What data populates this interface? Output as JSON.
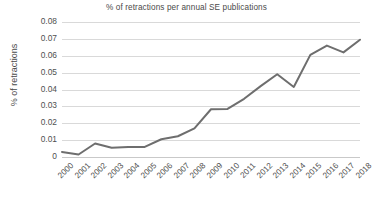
{
  "chart_data": {
    "type": "line",
    "title": "% of retractions per annual SE publications",
    "xlabel": "",
    "ylabel": "% of retractions",
    "categories": [
      "2000",
      "2001",
      "2002",
      "2003",
      "2004",
      "2005",
      "2006",
      "2007",
      "2008",
      "2009",
      "2010",
      "2011",
      "2012",
      "2013",
      "2014",
      "2015",
      "2016",
      "2017",
      "2018"
    ],
    "values": [
      0.003,
      0.0015,
      0.008,
      0.0055,
      0.006,
      0.006,
      0.0105,
      0.0123,
      0.017,
      0.0283,
      0.0285,
      0.0345,
      0.042,
      0.049,
      0.0415,
      0.0605,
      0.066,
      0.062,
      0.0695
    ],
    "series": [
      {
        "name": "% of retractions",
        "values": [
          0.003,
          0.0015,
          0.008,
          0.0055,
          0.006,
          0.006,
          0.0105,
          0.0123,
          0.017,
          0.0283,
          0.0285,
          0.0345,
          0.042,
          0.049,
          0.0415,
          0.0605,
          0.066,
          0.062,
          0.0695
        ]
      }
    ],
    "ylim": [
      0,
      0.08
    ],
    "ytick_labels": [
      "0.08",
      "0.07",
      "0.06",
      "0.05",
      "0.04",
      "0.03",
      "0.02",
      "0.01",
      "0"
    ],
    "ytick_values": [
      0.08,
      0.07,
      0.06,
      0.05,
      0.04,
      0.03,
      0.02,
      0.01,
      0
    ],
    "grid": true,
    "legend": false,
    "legend_position": "none",
    "line_color": "#6e6e6e",
    "grid_color": "#d9d9d9",
    "background_color": "#ffffff",
    "text_color": "#4a4a4a",
    "xtick_rotation": -45,
    "markers": false,
    "line_width": 2
  }
}
